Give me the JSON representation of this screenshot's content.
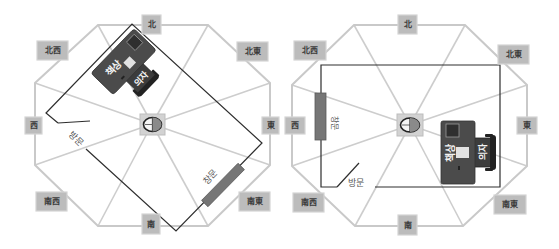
{
  "diagrams": [
    {
      "name": "left-layout",
      "directions": {
        "north": "北",
        "northwest": "北西",
        "northeast": "北東",
        "west": "西",
        "east": "東",
        "southwest": "南西",
        "southeast": "南東",
        "south": "南"
      },
      "room": {
        "desk": "책상",
        "chair": "의자",
        "window": "창문",
        "door": "방문"
      },
      "center_icon": "compass-icon"
    },
    {
      "name": "right-layout",
      "directions": {
        "north": "北",
        "northwest": "北西",
        "northeast": "北東",
        "west": "西",
        "east": "東",
        "southwest": "南西",
        "southeast": "南東",
        "south": "南"
      },
      "room": {
        "desk": "책상",
        "chair": "의자",
        "window": "창문",
        "door": "방문"
      },
      "center_icon": "compass-icon"
    }
  ],
  "colors": {
    "octagon_line": "#c9c9c9",
    "direction_label_bg": "#bcbcbc",
    "wall": "#2e2e2e",
    "window": "#767676",
    "desk": "#4b4b4b"
  }
}
